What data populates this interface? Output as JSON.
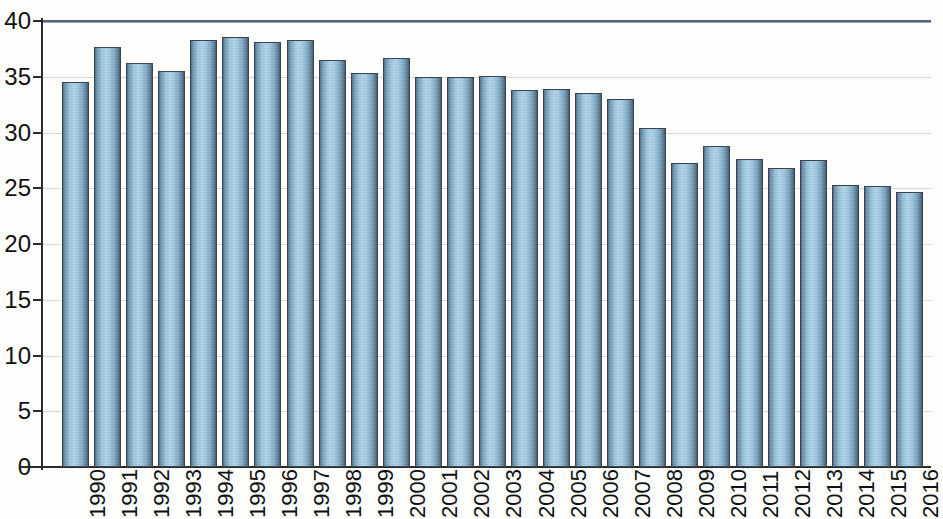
{
  "chart_data": {
    "type": "bar",
    "title": "",
    "subtitle": "",
    "xlabel": "",
    "ylabel": "",
    "ylim": [
      0,
      40
    ],
    "y_ticks": [
      0,
      5,
      10,
      15,
      20,
      25,
      30,
      35,
      40
    ],
    "grid": true,
    "legend": "none",
    "bar_color": "#9cc4dd",
    "bar_edge_color": "#3a4450",
    "categories": [
      "1990",
      "1991",
      "1992",
      "1993",
      "1994",
      "1995",
      "1996",
      "1997",
      "1998",
      "1999",
      "2000",
      "2001",
      "2002",
      "2003",
      "2004",
      "2005",
      "2006",
      "2007",
      "2008",
      "2009",
      "2010",
      "2011",
      "2012",
      "2013",
      "2014",
      "2015",
      "2016"
    ],
    "values": [
      34.5,
      37.7,
      36.2,
      35.5,
      38.3,
      38.6,
      38.1,
      38.3,
      36.5,
      35.3,
      36.7,
      35.0,
      35.0,
      35.1,
      33.8,
      33.9,
      33.5,
      33.0,
      30.4,
      27.3,
      28.8,
      27.6,
      26.8,
      27.5,
      25.3,
      25.2,
      24.7
    ]
  }
}
